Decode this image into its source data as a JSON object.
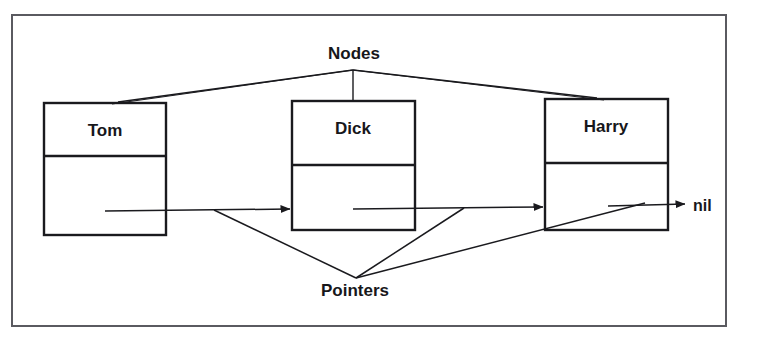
{
  "figure": {
    "kind": "linked-list-diagram",
    "background_color": "#ffffff",
    "stroke_color": "#1a1a1e",
    "frame": {
      "name": "outer-border",
      "x": 11,
      "y": 14,
      "width": 716,
      "height": 313,
      "stroke_width": 2
    }
  },
  "nodes": [
    {
      "id": "tom",
      "label": "Tom",
      "x": 44,
      "y": 103,
      "width": 122,
      "height": 132,
      "divider_y": 156,
      "label_x": 105,
      "label_y": 136
    },
    {
      "id": "dick",
      "label": "Dick",
      "x": 292,
      "y": 101,
      "width": 123,
      "height": 129,
      "divider_y": 165,
      "label_x": 353,
      "label_y": 134
    },
    {
      "id": "harry",
      "label": "Harry",
      "x": 545,
      "y": 99,
      "width": 123,
      "height": 131,
      "divider_y": 163,
      "label_x": 606,
      "label_y": 132
    }
  ],
  "pointer_arrows": [
    {
      "id": "tom-to-dick",
      "x1": 105,
      "y1": 211,
      "x2": 290,
      "y2": 209
    },
    {
      "id": "dick-to-harry",
      "x1": 353,
      "y1": 209,
      "x2": 543,
      "y2": 207
    },
    {
      "id": "harry-to-nil",
      "x1": 608,
      "y1": 206,
      "x2": 685,
      "y2": 204
    }
  ],
  "terminator": {
    "id": "nil-terminator",
    "label": "nil",
    "x": 693,
    "y": 211
  },
  "callouts": [
    {
      "id": "nodes-callout",
      "label": "Nodes",
      "label_x": 354,
      "label_y": 59,
      "apex_x": 353,
      "apex_y": 70,
      "leaders": [
        {
          "id": "nodes-leader-left",
          "x": 118,
          "y": 102
        },
        {
          "id": "nodes-leader-middle",
          "x": 353,
          "y": 101
        },
        {
          "id": "nodes-leader-right",
          "x": 597,
          "y": 98
        }
      ]
    },
    {
      "id": "pointers-callout",
      "label": "Pointers",
      "label_x": 355,
      "label_y": 296,
      "apex_x": 356,
      "apex_y": 278,
      "leaders": [
        {
          "id": "pointers-leader-left",
          "x": 214,
          "y": 210
        },
        {
          "id": "pointers-leader-middle",
          "x": 464,
          "y": 208
        },
        {
          "id": "pointers-leader-right",
          "x": 645,
          "y": 203
        }
      ]
    }
  ]
}
